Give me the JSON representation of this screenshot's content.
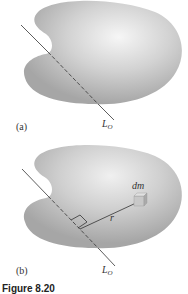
{
  "figure": {
    "caption": "Figure 8.20",
    "panels": [
      {
        "id": "a",
        "label": "(a)",
        "axis_label": "L",
        "axis_sub": "O"
      },
      {
        "id": "b",
        "label": "(b)",
        "axis_label": "L",
        "axis_sub": "O",
        "mass_element_label": "dm",
        "distance_label": "r"
      }
    ]
  },
  "colors": {
    "body_fill_dark": "#a8a8a8",
    "body_fill_light": "#f4f4f4",
    "line": "#333333",
    "background": "#ffffff"
  }
}
